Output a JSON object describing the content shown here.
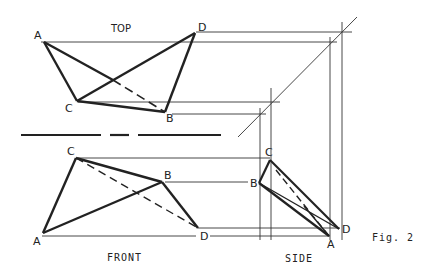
{
  "figure": {
    "caption": "Fig. 2",
    "views": {
      "top": {
        "title": "TOP",
        "points": {
          "A": "A",
          "B": "B",
          "C": "C",
          "D": "D"
        }
      },
      "front": {
        "title": "FRONT",
        "points": {
          "A": "A",
          "B": "B",
          "C": "C",
          "D": "D"
        }
      },
      "side": {
        "title": "SIDE",
        "points": {
          "A": "A",
          "B": "B",
          "C": "C",
          "D": "D"
        }
      }
    },
    "colors": {
      "ink": "#222222",
      "background": "#ffffff"
    }
  }
}
